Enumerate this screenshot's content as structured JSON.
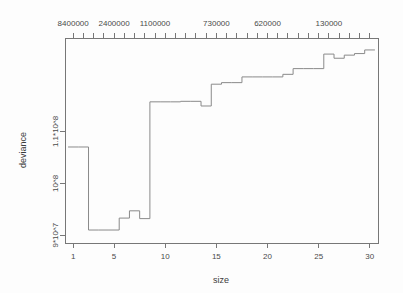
{
  "chart_data": {
    "type": "line",
    "subtype": "step",
    "title": "",
    "xlabel": "size",
    "ylabel": "deviance",
    "xlim": [
      0.2,
      30.8
    ],
    "ylim": [
      88500000,
      128000000
    ],
    "grid": false,
    "legend": null,
    "x_ticks": [
      1,
      5,
      10,
      15,
      20,
      25,
      30
    ],
    "x_tick_labels": [
      "1",
      "5",
      "10",
      "15",
      "20",
      "25",
      "30"
    ],
    "y_ticks": [
      90000000,
      100000000,
      110000000
    ],
    "y_tick_labels": [
      "9*10^7",
      "10^8",
      "1.1*10^8"
    ],
    "top_axis_label": "",
    "top_tick_labels": [
      "8400000",
      "2400000",
      "1100000",
      "730000",
      "620000",
      "130000"
    ],
    "top_tick_positions": [
      1,
      5,
      9,
      15,
      20,
      26
    ],
    "x": [
      1,
      2,
      3,
      4,
      5,
      6,
      7,
      8,
      9,
      10,
      11,
      12,
      13,
      14,
      15,
      16,
      17,
      18,
      19,
      20,
      21,
      22,
      23,
      24,
      25,
      26,
      27,
      28,
      29,
      30
    ],
    "values": [
      107000000,
      107000000,
      91000000,
      91000000,
      91000000,
      93300000,
      94700000,
      93200000,
      115700000,
      115700000,
      115700000,
      115800000,
      115800000,
      114900000,
      119100000,
      119400000,
      119400000,
      120500000,
      120500000,
      120500000,
      120500000,
      121000000,
      122100000,
      122100000,
      122100000,
      124900000,
      124100000,
      124700000,
      125000000,
      125700000
    ]
  },
  "axes": {
    "x_title": "size",
    "y_title": "deviance"
  }
}
